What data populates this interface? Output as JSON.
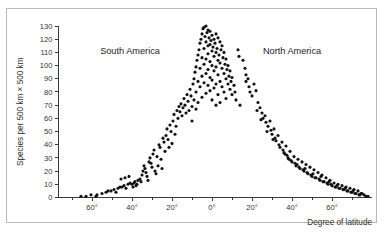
{
  "chart_data": {
    "type": "scatter",
    "title": "",
    "xlabel": "Degree of latitude",
    "ylabel": "Species per 500 km × 500 km",
    "xlim": [
      -75,
      80
    ],
    "ylim": [
      0,
      133
    ],
    "grid": false,
    "legend_position": "none",
    "x_ticks": [
      -60,
      -40,
      -20,
      0,
      20,
      40,
      60
    ],
    "x_ticklabels": [
      "60°",
      "40°",
      "20°",
      "0°",
      "20°",
      "40°",
      "60°"
    ],
    "x_minor_ticks": [
      -70,
      -50,
      -30,
      -10,
      10,
      30,
      50,
      70
    ],
    "y_ticks": [
      0,
      10,
      20,
      30,
      40,
      50,
      60,
      70,
      80,
      90,
      100,
      110,
      120,
      130
    ],
    "y_ticklabels": [
      "0",
      "10",
      "20",
      "30",
      "40",
      "50",
      "60",
      "70",
      "80",
      "90",
      "100",
      "110",
      "120",
      "130"
    ],
    "annotations": [
      {
        "text": "South America",
        "x": -41,
        "y": 111
      },
      {
        "text": "North America",
        "x": 40,
        "y": 111
      }
    ],
    "marker": {
      "shape": "circle",
      "color": "#111111",
      "radius": 1.55
    },
    "points": [
      [
        -65.5,
        1
      ],
      [
        -63.0,
        1
      ],
      [
        -60.5,
        2
      ],
      [
        -57.5,
        2
      ],
      [
        -53.0,
        4
      ],
      [
        -52.0,
        5
      ],
      [
        -50.5,
        5
      ],
      [
        -49.0,
        6
      ],
      [
        -47.0,
        7
      ],
      [
        -46.0,
        8
      ],
      [
        -45.0,
        8
      ],
      [
        -44.0,
        9
      ],
      [
        -43.0,
        7
      ],
      [
        -42.0,
        10
      ],
      [
        -41.0,
        11
      ],
      [
        -40.0,
        10
      ],
      [
        -39.0,
        11
      ],
      [
        -38.5,
        12
      ],
      [
        -38.0,
        9
      ],
      [
        -37.0,
        13
      ],
      [
        -36.0,
        14
      ],
      [
        -35.5,
        12
      ],
      [
        -35.0,
        17
      ],
      [
        -34.5,
        20
      ],
      [
        -34.0,
        24
      ],
      [
        -33.5,
        22
      ],
      [
        -33.0,
        19
      ],
      [
        -32.5,
        16
      ],
      [
        -32.0,
        13
      ],
      [
        -31.5,
        27
      ],
      [
        -31.0,
        30
      ],
      [
        -30.5,
        26
      ],
      [
        -30.0,
        23
      ],
      [
        -29.5,
        33
      ],
      [
        -29.0,
        36
      ],
      [
        -28.5,
        20
      ],
      [
        -28.0,
        18
      ],
      [
        -27.5,
        31
      ],
      [
        -27.0,
        24
      ],
      [
        -26.5,
        40
      ],
      [
        -26.0,
        38
      ],
      [
        -25.5,
        29
      ],
      [
        -25.0,
        22
      ],
      [
        -24.5,
        45
      ],
      [
        -24.0,
        42
      ],
      [
        -23.5,
        35
      ],
      [
        -23.0,
        47
      ],
      [
        -22.5,
        52
      ],
      [
        -22.0,
        44
      ],
      [
        -21.5,
        38
      ],
      [
        -21.0,
        55
      ],
      [
        -20.5,
        50
      ],
      [
        -20.0,
        41
      ],
      [
        -19.5,
        58
      ],
      [
        -19.0,
        63
      ],
      [
        -18.5,
        48
      ],
      [
        -18.0,
        54
      ],
      [
        -17.5,
        66
      ],
      [
        -17.0,
        60
      ],
      [
        -16.5,
        69
      ],
      [
        -16.0,
        65
      ],
      [
        -15.5,
        71
      ],
      [
        -15.0,
        62
      ],
      [
        -14.5,
        68
      ],
      [
        -14.0,
        75
      ],
      [
        -13.5,
        70
      ],
      [
        -13.0,
        64
      ],
      [
        -12.5,
        78
      ],
      [
        -12.0,
        73
      ],
      [
        -11.5,
        66
      ],
      [
        -11.0,
        82
      ],
      [
        -10.5,
        77
      ],
      [
        -10.0,
        69
      ],
      [
        -10.0,
        58
      ],
      [
        -9.5,
        86
      ],
      [
        -9.0,
        90
      ],
      [
        -9.0,
        74
      ],
      [
        -8.5,
        95
      ],
      [
        -8.0,
        99
      ],
      [
        -8.0,
        80
      ],
      [
        -8.0,
        67
      ],
      [
        -7.5,
        104
      ],
      [
        -7.0,
        108
      ],
      [
        -7.0,
        88
      ],
      [
        -7.0,
        72
      ],
      [
        -6.5,
        112
      ],
      [
        -6.0,
        117
      ],
      [
        -6.0,
        98
      ],
      [
        -6.0,
        84
      ],
      [
        -5.5,
        120
      ],
      [
        -5.0,
        124
      ],
      [
        -5.0,
        106
      ],
      [
        -5.0,
        92
      ],
      [
        -5.0,
        76
      ],
      [
        -4.5,
        128
      ],
      [
        -4.0,
        129
      ],
      [
        -4.0,
        113
      ],
      [
        -4.0,
        101
      ],
      [
        -4.0,
        87
      ],
      [
        -3.5,
        122
      ],
      [
        -3.0,
        130
      ],
      [
        -3.0,
        118
      ],
      [
        -3.0,
        105
      ],
      [
        -3.0,
        94
      ],
      [
        -3.0,
        79
      ],
      [
        -2.5,
        125
      ],
      [
        -2.0,
        127
      ],
      [
        -2.0,
        115
      ],
      [
        -2.0,
        109
      ],
      [
        -2.0,
        97
      ],
      [
        -2.0,
        85
      ],
      [
        -1.5,
        121
      ],
      [
        -1.0,
        126
      ],
      [
        -1.0,
        116
      ],
      [
        -1.0,
        103
      ],
      [
        -1.0,
        91
      ],
      [
        -1.0,
        81
      ],
      [
        -0.5,
        119
      ],
      [
        0.0,
        123
      ],
      [
        0.0,
        111
      ],
      [
        0.0,
        100
      ],
      [
        0.0,
        89
      ],
      [
        0.0,
        74
      ],
      [
        0.5,
        114
      ],
      [
        1.0,
        120
      ],
      [
        1.0,
        107
      ],
      [
        1.0,
        96
      ],
      [
        1.0,
        83
      ],
      [
        1.5,
        117
      ],
      [
        2.0,
        124
      ],
      [
        2.0,
        110
      ],
      [
        2.0,
        99
      ],
      [
        2.0,
        86
      ],
      [
        2.0,
        70
      ],
      [
        2.5,
        113
      ],
      [
        3.0,
        121
      ],
      [
        3.0,
        104
      ],
      [
        3.0,
        93
      ],
      [
        3.0,
        78
      ],
      [
        3.5,
        108
      ],
      [
        4.0,
        118
      ],
      [
        4.0,
        102
      ],
      [
        4.0,
        88
      ],
      [
        4.0,
        72
      ],
      [
        4.5,
        112
      ],
      [
        5.0,
        115
      ],
      [
        5.0,
        98
      ],
      [
        5.0,
        84
      ],
      [
        5.5,
        106
      ],
      [
        6.0,
        110
      ],
      [
        6.0,
        94
      ],
      [
        6.0,
        80
      ],
      [
        6.5,
        101
      ],
      [
        7.0,
        105
      ],
      [
        7.0,
        90
      ],
      [
        7.0,
        75
      ],
      [
        7.5,
        97
      ],
      [
        8.0,
        100
      ],
      [
        8.0,
        86
      ],
      [
        8.5,
        92
      ],
      [
        9.0,
        96
      ],
      [
        9.0,
        82
      ],
      [
        9.5,
        88
      ],
      [
        10.0,
        91
      ],
      [
        10.0,
        78
      ],
      [
        11.0,
        85
      ],
      [
        11.5,
        80
      ],
      [
        12.0,
        74
      ],
      [
        13.0,
        112
      ],
      [
        13.5,
        107
      ],
      [
        14.0,
        70
      ],
      [
        15.5,
        104
      ],
      [
        16.5,
        98
      ],
      [
        17.0,
        93
      ],
      [
        17.0,
        88
      ],
      [
        18.0,
        90
      ],
      [
        18.5,
        84
      ],
      [
        19.0,
        80
      ],
      [
        20.0,
        77
      ],
      [
        21.0,
        86
      ],
      [
        22.0,
        81
      ],
      [
        23.0,
        72
      ],
      [
        24.0,
        68
      ],
      [
        25.0,
        64
      ],
      [
        25.5,
        60
      ],
      [
        26.5,
        62
      ],
      [
        27.0,
        57
      ],
      [
        28.0,
        54
      ],
      [
        29.0,
        58
      ],
      [
        29.5,
        51
      ],
      [
        30.0,
        48
      ],
      [
        31.0,
        52
      ],
      [
        31.5,
        45
      ],
      [
        32.0,
        43
      ],
      [
        33.0,
        47
      ],
      [
        33.5,
        40
      ],
      [
        34.0,
        38
      ],
      [
        35.0,
        42
      ],
      [
        35.5,
        36
      ],
      [
        36.0,
        34
      ],
      [
        37.0,
        39
      ],
      [
        37.5,
        32
      ],
      [
        38.0,
        30
      ],
      [
        39.0,
        35
      ],
      [
        39.5,
        28
      ],
      [
        40.0,
        27
      ],
      [
        41.0,
        31
      ],
      [
        41.5,
        26
      ],
      [
        42.0,
        24
      ],
      [
        43.0,
        29
      ],
      [
        43.5,
        23
      ],
      [
        44.0,
        22
      ],
      [
        45.0,
        27
      ],
      [
        45.5,
        21
      ],
      [
        46.0,
        20
      ],
      [
        47.0,
        25
      ],
      [
        47.5,
        19
      ],
      [
        48.0,
        18
      ],
      [
        49.0,
        23
      ],
      [
        49.5,
        17
      ],
      [
        50.0,
        16
      ],
      [
        51.0,
        21
      ],
      [
        51.5,
        15
      ],
      [
        52.0,
        15
      ],
      [
        53.0,
        19
      ],
      [
        53.5,
        14
      ],
      [
        54.0,
        13
      ],
      [
        55.0,
        17
      ],
      [
        55.5,
        12
      ],
      [
        56.0,
        12
      ],
      [
        57.0,
        15
      ],
      [
        57.5,
        11
      ],
      [
        58.0,
        10
      ],
      [
        59.0,
        13
      ],
      [
        59.5,
        10
      ],
      [
        60.0,
        9
      ],
      [
        61.0,
        11
      ],
      [
        61.5,
        8
      ],
      [
        62.0,
        8
      ],
      [
        63.0,
        10
      ],
      [
        63.5,
        7
      ],
      [
        64.0,
        7
      ],
      [
        65.0,
        9
      ],
      [
        65.5,
        6
      ],
      [
        66.0,
        6
      ],
      [
        67.0,
        8
      ],
      [
        67.5,
        5
      ],
      [
        68.0,
        5
      ],
      [
        69.0,
        7
      ],
      [
        69.5,
        4
      ],
      [
        70.0,
        4
      ],
      [
        71.0,
        6
      ],
      [
        71.5,
        3
      ],
      [
        72.0,
        3
      ],
      [
        73.0,
        5
      ],
      [
        73.5,
        2
      ],
      [
        74.0,
        2
      ],
      [
        75.0,
        3
      ],
      [
        76.0,
        2
      ],
      [
        77.0,
        1
      ],
      [
        78.0,
        1
      ],
      [
        22.5,
        66
      ],
      [
        24.5,
        59
      ],
      [
        27.5,
        50
      ],
      [
        30.5,
        44
      ],
      [
        36.5,
        33
      ],
      [
        38.5,
        29
      ],
      [
        42.5,
        25
      ],
      [
        46.5,
        22
      ],
      [
        50.5,
        18
      ],
      [
        54.5,
        16
      ],
      [
        58.5,
        12
      ],
      [
        62.5,
        9
      ],
      [
        66.5,
        7
      ],
      [
        70.5,
        5
      ],
      [
        74.5,
        3
      ],
      [
        -45.5,
        14
      ],
      [
        -43.5,
        15
      ],
      [
        -41.5,
        16
      ],
      [
        -39.5,
        8
      ],
      [
        -37.5,
        10
      ],
      [
        -48.0,
        4
      ],
      [
        -55.0,
        3
      ],
      [
        -58.0,
        1
      ]
    ]
  }
}
